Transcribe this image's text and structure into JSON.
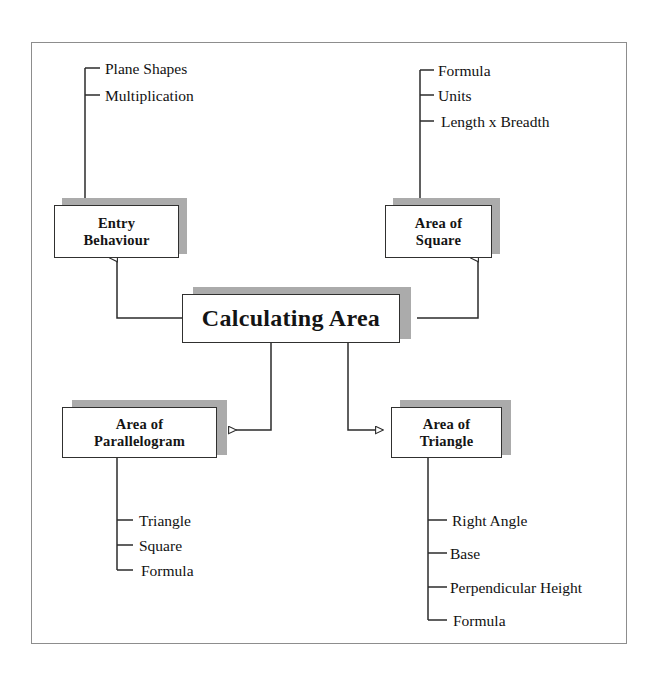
{
  "diagram": {
    "title": "Calculating Area",
    "type": "hierarchical-task-analysis",
    "frame": {
      "border_color": "#8d8d8d"
    },
    "colors": {
      "box_border": "#30302f",
      "box_fill": "#ffffff",
      "shadow": "#ababab",
      "connector": "#2b2b2b",
      "text": "#111111"
    },
    "root": {
      "label": "Calculating Area",
      "lines": [
        "Calculating Area"
      ]
    },
    "nodes": [
      {
        "id": "entry-behaviour",
        "label": "Entry Behaviour",
        "lines": [
          "Entry",
          "Behaviour"
        ],
        "position": "top-left",
        "leaves": [
          "Plane  Shapes",
          "Multiplication"
        ]
      },
      {
        "id": "area-of-square",
        "label": "Area of Square",
        "lines": [
          "Area  of",
          "Square"
        ],
        "position": "top-right",
        "leaves": [
          "Formula",
          "Units",
          "Length  x  Breadth"
        ]
      },
      {
        "id": "area-of-parallelogram",
        "label": "Area of Parallelogram",
        "lines": [
          "Area  of",
          "Parallelogram"
        ],
        "position": "bottom-left",
        "leaves": [
          "Triangle",
          "Square",
          "Formula"
        ]
      },
      {
        "id": "area-of-triangle",
        "label": "Area of Triangle",
        "lines": [
          "Area  of",
          "Triangle"
        ],
        "position": "bottom-right",
        "leaves": [
          "Right  Angle",
          "Base",
          "Perpendicular  Height",
          "Formula"
        ]
      }
    ],
    "leaf_labels": {
      "entry_1": "Plane  Shapes",
      "entry_2": "Multiplication",
      "square_1": "Formula",
      "square_2": "Units",
      "square_3": "Length  x  Breadth",
      "para_1": "Triangle",
      "para_2": "Square",
      "para_3": "Formula",
      "tri_1": "Right  Angle",
      "tri_2": "Base",
      "tri_3": "Perpendicular  Height",
      "tri_4": "Formula"
    },
    "box_lines": {
      "entry_l1": "Entry",
      "entry_l2": "Behaviour",
      "square_l1": "Area  of",
      "square_l2": "Square",
      "para_l1": "Area  of",
      "para_l2": "Parallelogram",
      "tri_l1": "Area  of",
      "tri_l2": "Triangle"
    }
  }
}
